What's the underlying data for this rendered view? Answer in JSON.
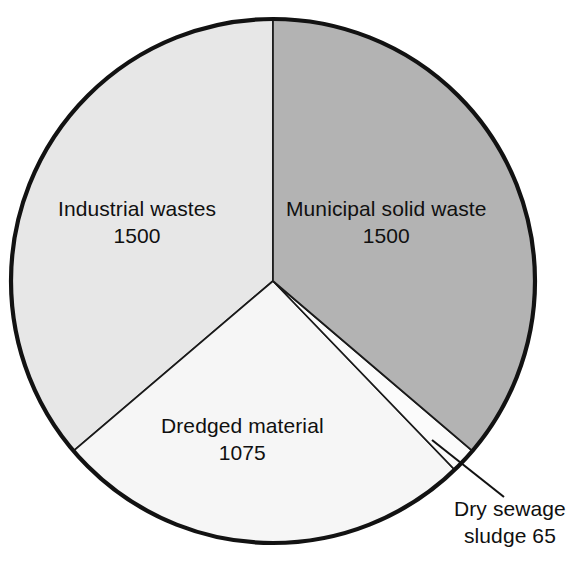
{
  "chart_data": {
    "type": "pie",
    "title": "",
    "subtitle": "",
    "xlabel": "",
    "ylabel": "",
    "legend_position": "none",
    "grid": false,
    "start_angle_deg": 0,
    "direction": "clockwise",
    "total": 4140,
    "categories": [
      "Municipal solid waste",
      "Dry sewage sludge",
      "Dredged material",
      "Industrial wastes"
    ],
    "values": [
      1500,
      65,
      1075,
      1500
    ],
    "slices": [
      {
        "label": "Municipal solid waste",
        "value": 1500,
        "value_text": "1500",
        "color": "#b3b3b3",
        "label_placement": "inside"
      },
      {
        "label": "Dry sewage sludge",
        "value": 65,
        "value_text": "65",
        "color": "#fbfbfb",
        "label_placement": "callout",
        "callout_line1": "Dry sewage",
        "callout_line2": "sludge 65"
      },
      {
        "label": "Dredged material",
        "value": 1075,
        "value_text": "1075",
        "color": "#f6f6f6",
        "label_placement": "inside"
      },
      {
        "label": "Industrial wastes",
        "value": 1500,
        "value_text": "1500",
        "color": "#e7e7e7",
        "label_placement": "inside"
      }
    ],
    "colors": {
      "outline": "#121212",
      "divider": "#1a1a1a",
      "municipal_solid_waste": "#b3b3b3",
      "industrial_wastes": "#e7e7e7",
      "dredged_material": "#f6f6f6",
      "dry_sewage_sludge": "#fbfbfb",
      "background": "#ffffff",
      "text": "#101010"
    }
  },
  "labels": {
    "municipal": {
      "name": "Municipal solid waste",
      "value": "1500"
    },
    "industrial": {
      "name": "Industrial wastes",
      "value": "1500"
    },
    "dredged": {
      "name": "Dredged material",
      "value": "1075"
    },
    "sludge": {
      "line1": "Dry sewage",
      "line2": "sludge 65"
    }
  }
}
